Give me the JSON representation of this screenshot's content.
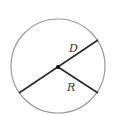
{
  "diagram": {
    "type": "circle-diameter-radius",
    "labels": {
      "diameter": "D",
      "radius": "R"
    },
    "colors": {
      "circle_stroke": "#9a9a9a",
      "line_stroke": "#2a2a2a",
      "center_dot": "#111111",
      "background": "#ffffff"
    }
  }
}
